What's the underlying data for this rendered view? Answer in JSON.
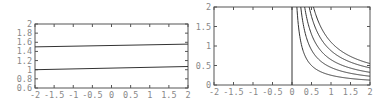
{
  "chart_data": [
    {
      "type": "line",
      "title": "",
      "xlabel": "",
      "ylabel": "",
      "xlim": [
        -2,
        2
      ],
      "ylim": [
        0.6,
        2
      ],
      "x_ticks": [
        "-2",
        "-1.5",
        "-1",
        "-0.5",
        "0",
        "0.5",
        "1",
        "1.5",
        "2"
      ],
      "y_ticks": [
        "0.6",
        "0.8",
        "1",
        "1.2",
        "1.4",
        "1.6",
        "1.8",
        "2"
      ],
      "grid": false,
      "legend": null,
      "series": [
        {
          "name": "upper",
          "x": [
            -2,
            2
          ],
          "values": [
            1.5,
            1.56
          ]
        },
        {
          "name": "lower",
          "x": [
            -2,
            2
          ],
          "values": [
            1.0,
            1.07
          ]
        }
      ]
    },
    {
      "type": "line",
      "title": "",
      "xlabel": "",
      "ylabel": "",
      "xlim": [
        -2,
        2
      ],
      "ylim": [
        0,
        2
      ],
      "x_ticks": [
        "-2",
        "-1.5",
        "-1",
        "-0.5",
        "0",
        "0.5",
        "1",
        "1.5",
        "2"
      ],
      "y_ticks": [
        "0",
        "0.5",
        "1",
        "1.5",
        "2"
      ],
      "grid": false,
      "legend": null,
      "vertical_line_x": 0,
      "series": [
        {
          "name": "c=0.25",
          "formula": "y = 0.25/x",
          "c": 0.25
        },
        {
          "name": "c=0.45",
          "formula": "y = 0.45/x",
          "c": 0.45
        },
        {
          "name": "c=0.65",
          "formula": "y = 0.65/x",
          "c": 0.65
        },
        {
          "name": "c=0.88",
          "formula": "y = 0.88/x",
          "c": 0.88
        },
        {
          "name": "c=1.1",
          "formula": "y = 1.1/x",
          "c": 1.1
        }
      ]
    }
  ]
}
